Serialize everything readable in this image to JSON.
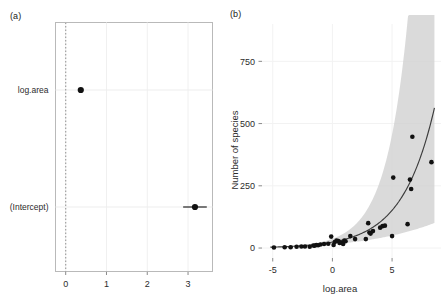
{
  "figure": {
    "panels": [
      {
        "key": "a",
        "label": "(a)",
        "name": "coefficient-plot"
      },
      {
        "key": "b",
        "label": "(b)",
        "name": "species-area-plot"
      }
    ]
  },
  "chart_data": [
    {
      "type": "scatter",
      "name": "coefficient-estimates",
      "title": "(a)",
      "xlabel": "",
      "ylabel": "",
      "xlim": [
        -0.25,
        3.6
      ],
      "xticks": [
        0,
        1,
        2,
        3
      ],
      "xtick_labels": [
        "0",
        "1",
        "2",
        "3"
      ],
      "categories": [
        "log.area",
        "(Intercept)"
      ],
      "grid": true,
      "reference_line": {
        "x": 0,
        "style": "dotted",
        "color": "#9a9a9a"
      },
      "points": [
        {
          "term": "log.area",
          "estimate": 0.37,
          "conf_low": 0.33,
          "conf_high": 0.41
        },
        {
          "term": "(Intercept)",
          "estimate": 3.17,
          "conf_low": 2.88,
          "conf_high": 3.46
        }
      ]
    },
    {
      "type": "scatter",
      "name": "species-vs-log-area",
      "title": "(b)",
      "xlabel": "log.area",
      "ylabel": "Number of species",
      "xlim": [
        -5.9,
        9.1
      ],
      "ylim": [
        -40,
        900
      ],
      "xticks": [
        -5,
        0,
        5
      ],
      "xtick_labels": [
        "-5",
        "0",
        "5"
      ],
      "yticks": [
        0,
        250,
        500,
        750
      ],
      "ytick_labels": [
        "0",
        "250",
        "500",
        "750"
      ],
      "grid": true,
      "legend": "none",
      "x": [
        -4.9,
        -4.0,
        -3.5,
        -3.0,
        -2.6,
        -2.3,
        -1.9,
        -1.6,
        -1.5,
        -1.35,
        -1.2,
        -1.0,
        -0.7,
        -0.35,
        -0.1,
        0.1,
        0.2,
        0.35,
        0.5,
        0.6,
        0.75,
        0.9,
        1.0,
        1.1,
        1.5,
        1.9,
        2.8,
        3.0,
        3.1,
        3.2,
        3.4,
        4.0,
        4.2,
        4.4,
        5.0,
        5.1,
        6.3,
        6.5,
        6.6,
        6.7,
        8.3
      ],
      "y": [
        2,
        3,
        3,
        5,
        6,
        6,
        5,
        10,
        9,
        12,
        11,
        14,
        16,
        17,
        46,
        12,
        24,
        30,
        28,
        20,
        22,
        16,
        30,
        27,
        48,
        36,
        36,
        100,
        62,
        58,
        68,
        82,
        88,
        90,
        48,
        283,
        96,
        275,
        237,
        447,
        345
      ],
      "fit_curve": {
        "model": "poisson-glm-log-link",
        "formula": "exp(3.17 + 0.37 * log.area)",
        "intercept": 3.17,
        "slope": 0.37,
        "color": "#3c3c3c"
      },
      "confidence_band": {
        "level": 0.95,
        "color": "#cccccc",
        "description": "grey ribbon widening toward high log.area"
      }
    }
  ]
}
